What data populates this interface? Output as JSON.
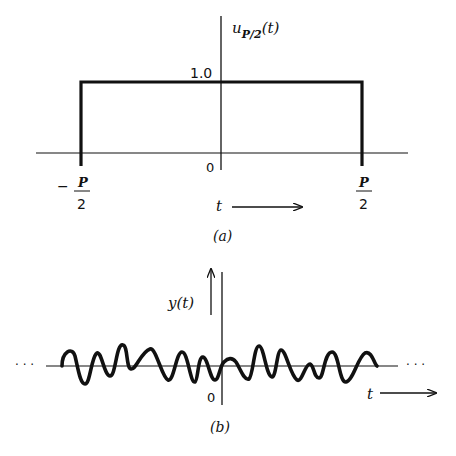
{
  "figure_a": {
    "caption": "(a)",
    "y_label_main": "u",
    "y_label_sub": "P/2",
    "y_label_arg": "(t)",
    "level_label": "1.0",
    "origin_label": "0",
    "left_edge": {
      "sign": "−",
      "numerator": "P",
      "denominator": "2"
    },
    "right_edge": {
      "numerator": "P",
      "denominator": "2"
    },
    "x_label": "t"
  },
  "figure_b": {
    "caption": "(b)",
    "y_label": "y(t)",
    "origin_label": "0",
    "x_label": "t",
    "continuation_left": "· · ·",
    "continuation_right": "· · ·"
  },
  "colors": {
    "ink": "#111111",
    "background": "#ffffff"
  }
}
